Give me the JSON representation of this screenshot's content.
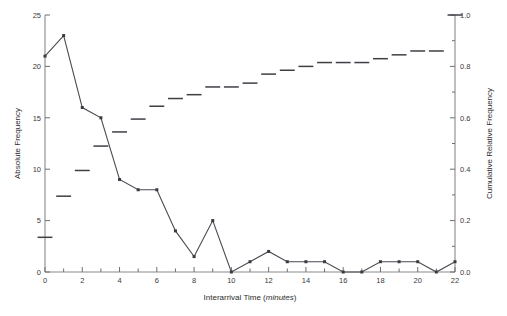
{
  "chart_data": {
    "type": "line",
    "title": "",
    "xlabel": "Interarrival Time (minutes)",
    "xlabel_plain": "Interarrival Time (",
    "xlabel_italic": "minutes",
    "xlabel_tail": ")",
    "ylabel": "Absolute Frequency",
    "ylabel_right": "Cumulative Relative Frequency",
    "xlim": [
      0,
      22
    ],
    "ylim": [
      0,
      25
    ],
    "ylim_right": [
      0.0,
      1.0
    ],
    "grid": false,
    "legend": "none",
    "xticks": [
      0,
      2,
      4,
      6,
      8,
      10,
      12,
      14,
      16,
      18,
      20,
      22
    ],
    "xticklabels": [
      "0",
      "2",
      "4",
      "6",
      "8",
      "10",
      "12",
      "14",
      "16",
      "18",
      "20",
      "22"
    ],
    "xminorticks": [
      1,
      3,
      5,
      7,
      9,
      11,
      13,
      15,
      17,
      19,
      21
    ],
    "yticks": [
      0,
      5,
      10,
      15,
      20,
      25
    ],
    "yticklabels": [
      "0",
      "5",
      "10",
      "15",
      "20",
      "25"
    ],
    "yticks_right": [
      0.0,
      0.2,
      0.4,
      0.6,
      0.8,
      1.0
    ],
    "yticklabels_right": [
      "0.0",
      "0.2",
      "0.4",
      "0.6",
      "0.8",
      "1.0"
    ],
    "x": [
      0,
      1,
      2,
      3,
      4,
      5,
      6,
      7,
      8,
      9,
      10,
      11,
      12,
      13,
      14,
      15,
      16,
      17,
      18,
      19,
      20,
      21,
      22
    ],
    "series": [
      {
        "name": "Absolute Frequency",
        "axis": "left",
        "marker": "square",
        "values": [
          21,
          23,
          16,
          15,
          9,
          8,
          8,
          4,
          1.5,
          5,
          0,
          1,
          2,
          1,
          1,
          1,
          0,
          0,
          1,
          1,
          1,
          0,
          1
        ]
      },
      {
        "name": "Cumulative Relative Frequency",
        "axis": "right",
        "marker": "dash",
        "values": [
          0.135,
          0.295,
          0.395,
          0.49,
          0.545,
          0.595,
          0.645,
          0.675,
          0.69,
          0.72,
          0.72,
          0.735,
          0.77,
          0.785,
          0.8,
          0.815,
          0.815,
          0.815,
          0.83,
          0.845,
          0.86,
          0.86,
          1.0
        ]
      }
    ],
    "cumulative_marks": [
      {
        "x": 0,
        "y": 0.135
      },
      {
        "x": 1,
        "y": 0.295
      },
      {
        "x": 2,
        "y": 0.395
      },
      {
        "x": 3,
        "y": 0.49
      },
      {
        "x": 4,
        "y": 0.545
      },
      {
        "x": 5,
        "y": 0.595
      },
      {
        "x": 6,
        "y": 0.645
      },
      {
        "x": 7,
        "y": 0.675
      },
      {
        "x": 8,
        "y": 0.69
      },
      {
        "x": 9,
        "y": 0.72
      },
      {
        "x": 10,
        "y": 0.72
      },
      {
        "x": 11,
        "y": 0.735
      },
      {
        "x": 12,
        "y": 0.77
      },
      {
        "x": 13,
        "y": 0.785
      },
      {
        "x": 14,
        "y": 0.8
      },
      {
        "x": 15,
        "y": 0.815
      },
      {
        "x": 16,
        "y": 0.815
      },
      {
        "x": 17,
        "y": 0.815
      },
      {
        "x": 18,
        "y": 0.83
      },
      {
        "x": 19,
        "y": 0.845
      },
      {
        "x": 20,
        "y": 0.86
      },
      {
        "x": 21,
        "y": 0.86
      },
      {
        "x": 22,
        "y": 1.0
      }
    ],
    "colors": {
      "line": "#4a4a52",
      "axis": "#8a8a8a",
      "text": "#2b2b2b",
      "background": "#ffffff"
    }
  }
}
